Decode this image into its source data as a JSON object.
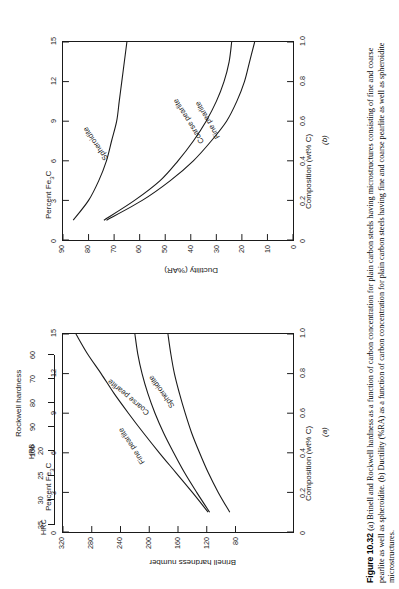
{
  "figure": {
    "number": "Figure 10.32",
    "caption": "(a) Brinell and Rockwell hardness as a function of carbon concentration for plain carbon steels having microstructures consisting of fine and coarse pearlite as well as spheroidite. (b) Ductility (%RA) as a function of carbon concentration for plain carbon steels having fine and coarse pearlite as well as spheroidite microstructures."
  },
  "panels": {
    "a": {
      "id": "(a)"
    },
    "b": {
      "id": "(b)"
    }
  },
  "chart_data": [
    {
      "type": "line",
      "panel": "(a)",
      "title": "",
      "xlabel": "Composition (wt% C)",
      "ylabel": "Brinell hardness number",
      "xlim": [
        0,
        1.0
      ],
      "ylim": [
        0,
        320
      ],
      "xticks": [
        "0",
        "0.2",
        "0.4",
        "0.6",
        "0.8",
        "1.0"
      ],
      "yticks": [
        "80",
        "120",
        "160",
        "200",
        "240",
        "280",
        "320"
      ],
      "grid": false,
      "secondary_x": {
        "label": "Percent Fe3C",
        "ticks": [
          "0",
          "3",
          "6",
          "9",
          "12",
          "15"
        ],
        "lim": [
          0,
          15
        ]
      },
      "secondary_y": {
        "label": "Rockwell hardness",
        "scales": [
          {
            "name": "HRC",
            "ticks": [
              "20",
              "25",
              "30",
              "35"
            ]
          },
          {
            "name": "HRB",
            "ticks": [
              "60",
              "70",
              "80",
              "90",
              "100"
            ]
          }
        ]
      },
      "series": [
        {
          "name": "Fine pearlite",
          "x": [
            0.1,
            0.2,
            0.3,
            0.4,
            0.5,
            0.6,
            0.7,
            0.8,
            0.9,
            1.0
          ],
          "y": [
            118,
            140,
            163,
            186,
            208,
            229,
            249,
            267,
            286,
            302
          ]
        },
        {
          "name": "Coarse pearlite",
          "x": [
            0.1,
            0.2,
            0.3,
            0.4,
            0.5,
            0.6,
            0.7,
            0.8,
            0.9,
            1.0
          ],
          "y": [
            116,
            134,
            151,
            166,
            180,
            192,
            202,
            210,
            216,
            220
          ]
        },
        {
          "name": "Spheroidite",
          "x": [
            0.1,
            0.2,
            0.3,
            0.4,
            0.5,
            0.6,
            0.7,
            0.8,
            0.9,
            1.0
          ],
          "y": [
            88,
            104,
            118,
            130,
            141,
            150,
            158,
            165,
            170,
            174
          ]
        }
      ]
    },
    {
      "type": "line",
      "panel": "(b)",
      "title": "",
      "xlabel": "Composition (wt% C)",
      "ylabel": "Ductility (%AR)",
      "xlim": [
        0,
        1.0
      ],
      "ylim": [
        0,
        90
      ],
      "xticks": [
        "0",
        "0.2",
        "0.4",
        "0.6",
        "0.8",
        "1.0"
      ],
      "yticks": [
        "0",
        "10",
        "20",
        "30",
        "40",
        "50",
        "60",
        "70",
        "80",
        "90"
      ],
      "grid": false,
      "secondary_x": {
        "label": "Percent Fe3C",
        "ticks": [
          "0",
          "3",
          "6",
          "9",
          "12",
          "15"
        ],
        "lim": [
          0,
          15
        ]
      },
      "series": [
        {
          "name": "Spheroidite",
          "x": [
            0.1,
            0.2,
            0.3,
            0.4,
            0.5,
            0.6,
            0.7,
            0.8,
            0.9,
            1.0
          ],
          "y": [
            86,
            80,
            76,
            73,
            71,
            69,
            68,
            67,
            66,
            65
          ]
        },
        {
          "name": "Coarse pearlite",
          "x": [
            0.1,
            0.2,
            0.3,
            0.4,
            0.5,
            0.6,
            0.7,
            0.8,
            0.9,
            1.0
          ],
          "y": [
            74,
            62,
            52,
            45,
            39,
            34,
            30,
            27,
            25,
            24
          ]
        },
        {
          "name": "Fine pearlite",
          "x": [
            0.1,
            0.2,
            0.3,
            0.4,
            0.5,
            0.6,
            0.7,
            0.8,
            0.9,
            1.0
          ],
          "y": [
            73,
            59,
            48,
            39,
            32,
            26,
            22,
            19,
            17,
            15
          ]
        }
      ]
    }
  ],
  "labels": {
    "percent_fe3c": "Percent Fe",
    "percent_fe3c_sub": "3",
    "percent_fe3c_tail": "C",
    "composition": "Composition (wt% C)",
    "brinell": "Brinell hardness number",
    "ductility": "Ductility (%AR)",
    "rockwell": "Rockwell hardness",
    "hrc": "HRC",
    "hrb": "HRB",
    "fine_pearlite": "Fine pearlite",
    "coarse_pearlite": "Coarse pearlite",
    "spheroidite": "Spheroidite"
  }
}
